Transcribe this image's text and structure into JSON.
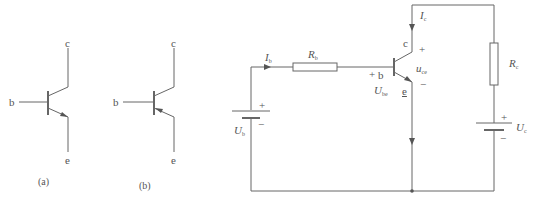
{
  "figure_a": {
    "caption": "(a)",
    "type": "NPN transistor symbol",
    "terminals": {
      "collector": "c",
      "base": "b",
      "emitter": "e"
    }
  },
  "figure_b": {
    "caption": "(b)",
    "type": "PNP transistor symbol",
    "terminals": {
      "collector": "c",
      "base": "b",
      "emitter": "e"
    }
  },
  "circuit": {
    "base_current": {
      "symbol": "I",
      "sub": "b"
    },
    "base_resistor": {
      "symbol": "R",
      "sub": "b"
    },
    "base_supply": {
      "symbol": "U",
      "sub": "b",
      "plus": "+",
      "minus": "−"
    },
    "collector_current": {
      "symbol": "I",
      "sub": "c"
    },
    "collector_resistor": {
      "symbol": "R",
      "sub": "c"
    },
    "collector_supply": {
      "symbol": "U",
      "sub": "c",
      "plus": "+",
      "minus": "−"
    },
    "transistor": {
      "base": "b",
      "collector": "c",
      "emitter": "e",
      "base_plus": "+"
    },
    "vce": {
      "symbol": "u",
      "sub": "ce",
      "plus": "+",
      "minus": "−"
    },
    "vbe": {
      "symbol": "U",
      "sub": "be"
    }
  }
}
